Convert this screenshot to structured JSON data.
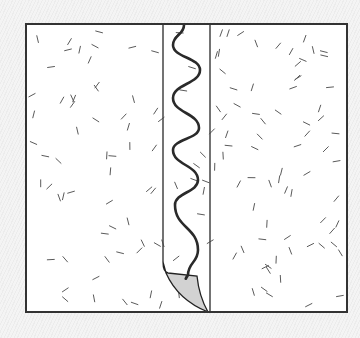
{
  "diagram": {
    "frame": {
      "x": 26,
      "y": 24,
      "width": 321,
      "height": 288,
      "stroke": "#333333",
      "fill": "#ffffff"
    },
    "strip": {
      "left_x": 163,
      "right_x": 210,
      "stroke": "#444444"
    },
    "wave": {
      "stroke": "#2a2a2a",
      "points": [
        [
          184,
          25
        ],
        [
          173,
          45
        ],
        [
          200,
          70
        ],
        [
          173,
          98
        ],
        [
          199,
          128
        ],
        [
          173,
          150
        ],
        [
          198,
          180
        ],
        [
          175,
          205
        ],
        [
          198,
          250
        ],
        [
          188,
          275
        ]
      ]
    },
    "peel": {
      "fill": "#d2d2d2",
      "stroke": "#222222",
      "tip": [
        208,
        312
      ]
    },
    "texture": {
      "mark_color": "#5a5a5a",
      "mark_length": 7,
      "density": 150,
      "seed": 17
    }
  }
}
